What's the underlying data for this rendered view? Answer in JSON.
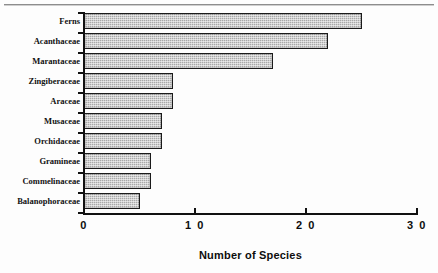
{
  "figure": {
    "background_color": "#fdfdfd",
    "rule_color": "#8d8d8d",
    "bar_fill_color": "#a8a8a8",
    "bar_border_color": "#1a1a1a",
    "axis_color": "#111111"
  },
  "chart_data": {
    "type": "bar",
    "orientation": "horizontal",
    "title": "",
    "subtitle": "",
    "xlabel": "Number of Species",
    "ylabel": "",
    "xlim": [
      0,
      30
    ],
    "xticks": [
      0,
      10,
      20,
      30
    ],
    "xticklabels": [
      "0",
      "1 0",
      "2 0",
      "3 0"
    ],
    "grid": false,
    "legend": false,
    "legend_position": "none",
    "categories": [
      "Ferns",
      "Acanthaceae",
      "Marantaceae",
      "Zingiberaceae",
      "Araceae",
      "Musaceae",
      "Orchidaceae",
      "Gramineae",
      "Commelinaceae",
      "Balanophoraceae"
    ],
    "values": [
      25,
      22,
      17,
      8,
      8,
      7,
      7,
      6,
      6,
      5
    ]
  }
}
